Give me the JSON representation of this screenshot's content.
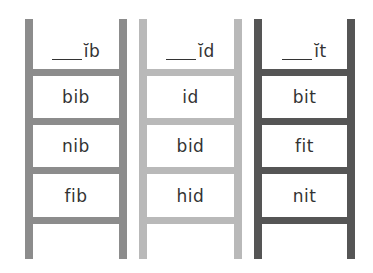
{
  "ladders": [
    {
      "header": {
        "blank": "___",
        "pattern": "ĭb"
      },
      "words": [
        "bib",
        "nib",
        "fib"
      ],
      "color": "#8c8c8c"
    },
    {
      "header": {
        "blank": "___",
        "pattern": "ĭd"
      },
      "words": [
        "id",
        "bid",
        "hid"
      ],
      "color": "#b9b9b9"
    },
    {
      "header": {
        "blank": "___",
        "pattern": "ĭt"
      },
      "words": [
        "bit",
        "fit",
        "nit"
      ],
      "color": "#555555"
    }
  ]
}
